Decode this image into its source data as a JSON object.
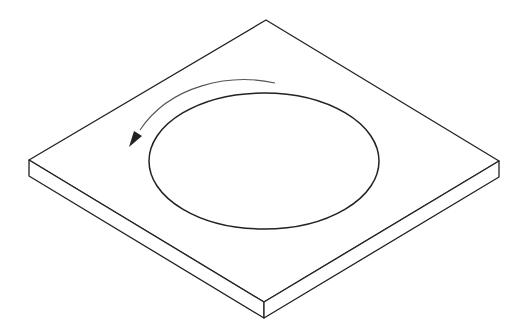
{
  "figure": {
    "colors": {
      "background": "#ffffff",
      "stroke": "#222222",
      "arrow_stroke": "#555555"
    },
    "plate": {
      "top_face": [
        [
          266,
          20
        ],
        [
          499,
          161
        ],
        [
          264,
          302
        ],
        [
          29,
          160
        ]
      ],
      "thickness_px": 16
    },
    "recess": {
      "cx": 264,
      "cy": 161,
      "rx": 115,
      "ry": 68
    },
    "rotation_arrow": {
      "direction": "counter-clockwise"
    }
  }
}
